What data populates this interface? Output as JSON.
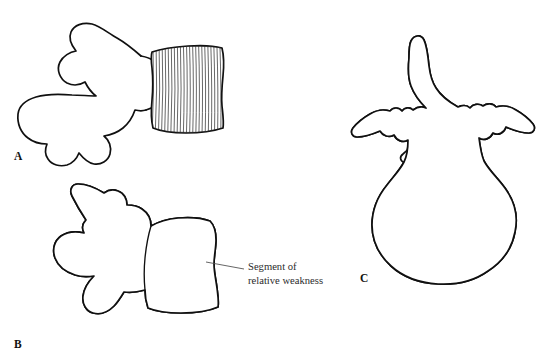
{
  "figure": {
    "background_color": "#ffffff",
    "ink_color": "#101010",
    "hatch_color": "#262626",
    "text_color": "#2b2b2b",
    "width": 552,
    "height": 358
  },
  "panels": [
    {
      "id": "A",
      "letter": "A",
      "view": "lateral view, vertebral body hatching only",
      "letter_x": 14,
      "letter_y": 160
    },
    {
      "id": "B",
      "letter": "B",
      "view": "lateral view, full trabecular systems crosshatched",
      "letter_x": 14,
      "letter_y": 348
    },
    {
      "id": "C",
      "letter": "C",
      "view": "posterior view, trabecular systems crosshatched",
      "letter_x": 360,
      "letter_y": 282
    }
  ],
  "callout": {
    "label_line_1": "Segment of",
    "label_line_2": "relative weakness",
    "text_x": 248,
    "text_y_line_1": 270,
    "text_y_line_2": 284,
    "leader_from_x": 206,
    "leader_from_y": 262,
    "leader_to_x": 244,
    "leader_to_y": 269
  },
  "hatching": {
    "panel_a_body_lines": 26,
    "panel_b_line_sets": 4,
    "panel_c_line_sets": 5
  }
}
